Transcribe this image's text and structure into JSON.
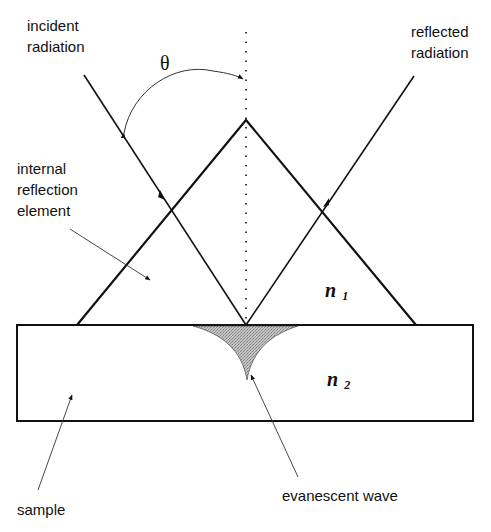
{
  "diagram": {
    "labels": {
      "incident": [
        "incident",
        "radiation"
      ],
      "reflected": [
        "reflected",
        "radiation"
      ],
      "angle": "θ",
      "ire": [
        "internal",
        "reflection",
        "element"
      ],
      "n1": "n",
      "n1_sub": "1",
      "n2": "n",
      "n2_sub": "2",
      "sample": "sample",
      "evanescent": "evanescent wave"
    },
    "colors": {
      "line": "#111111",
      "evanescent_fill": "#b0b0b0",
      "background": "#ffffff"
    }
  }
}
